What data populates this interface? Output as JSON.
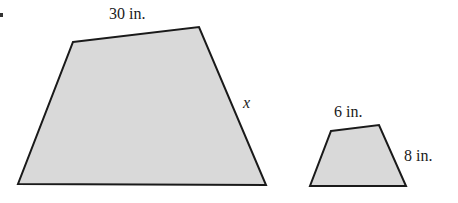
{
  "figure": {
    "fill_color": "#d9d9d9",
    "stroke_color": "#1a1a1a",
    "large_trapezoid": {
      "top_label": "30 in.",
      "side_label": "x",
      "points": "73,42 199,27 266,185 18,184"
    },
    "small_trapezoid": {
      "top_label": "6 in.",
      "side_label": "8 in.",
      "points": "331,131 379,125 406,186 310,186"
    }
  }
}
